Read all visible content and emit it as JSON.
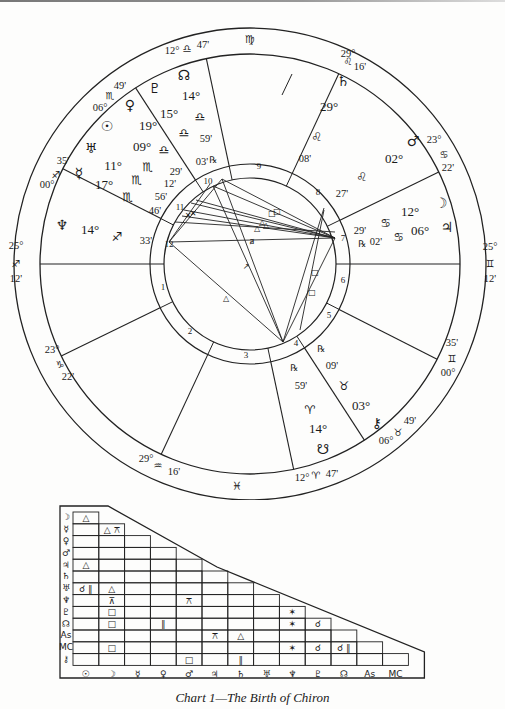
{
  "caption": "Chart 1—The Birth of Chiron",
  "chart_data": {
    "type": "astrological-natal-chart",
    "title": "Chart 1—The Birth of Chiron",
    "house_cusps": [
      {
        "house": 1,
        "label": "Asc",
        "degree": "25°",
        "sign": "♐",
        "minute": "12'"
      },
      {
        "house": 2,
        "degree": "23°",
        "sign": "♑",
        "minute": "22'"
      },
      {
        "house": 3,
        "degree": "29°",
        "sign": "♒",
        "minute": "16'"
      },
      {
        "house": 4,
        "label": "IC",
        "degree": "12°",
        "sign": "♈",
        "minute": "47'"
      },
      {
        "house": 5,
        "degree": "06°",
        "sign": "♉",
        "minute": "49'"
      },
      {
        "house": 6,
        "degree": "00°",
        "sign": "♊",
        "minute": "35'"
      },
      {
        "house": 7,
        "label": "Dsc",
        "degree": "25°",
        "sign": "♊",
        "minute": "12'"
      },
      {
        "house": 8,
        "degree": "23°",
        "sign": "♋",
        "minute": "22'"
      },
      {
        "house": 9,
        "degree": "29°",
        "sign": "♌",
        "minute": "16'"
      },
      {
        "house": 10,
        "label": "MC",
        "degree": "12°",
        "sign": "♎",
        "minute": "47'"
      },
      {
        "house": 11,
        "degree": "06°",
        "sign": "♏",
        "minute": "49'"
      },
      {
        "house": 12,
        "degree": "00°",
        "sign": "♐",
        "minute": "35'"
      }
    ],
    "intercepted_signs": [
      {
        "sign": "♍",
        "position": "top"
      },
      {
        "sign": "♓",
        "position": "bottom"
      }
    ],
    "planets": [
      {
        "name": "Sun",
        "glyph": "☉",
        "degree": "09°",
        "sign": "♏",
        "minute": "12'"
      },
      {
        "name": "Moon",
        "glyph": "☽",
        "degree": "12°",
        "sign": "♋",
        "minute": "29'"
      },
      {
        "name": "Mercury",
        "glyph": "☿",
        "degree": "17°",
        "sign": "♏",
        "minute": "46'"
      },
      {
        "name": "Venus",
        "glyph": "♀",
        "degree": "19°",
        "sign": "♎",
        "minute": "29'"
      },
      {
        "name": "Mars",
        "glyph": "♂",
        "degree": "02°",
        "sign": "♌",
        "minute": "27'"
      },
      {
        "name": "Jupiter",
        "glyph": "♃",
        "degree": "06°",
        "sign": "♋",
        "minute": "02'",
        "retrograde": true
      },
      {
        "name": "Saturn",
        "glyph": "♄",
        "degree": "29°",
        "sign": "♌",
        "minute": "08'"
      },
      {
        "name": "Uranus",
        "glyph": "♅",
        "degree": "11°",
        "sign": "♏",
        "minute": "56'"
      },
      {
        "name": "Neptune",
        "glyph": "♆",
        "degree": "14°",
        "sign": "♐",
        "minute": "33'"
      },
      {
        "name": "Pluto",
        "glyph": "♇",
        "degree": "15°",
        "sign": "♎",
        "minute": "03'",
        "retrograde": true
      },
      {
        "name": "North Node",
        "glyph": "☊",
        "degree": "14°",
        "sign": "♎",
        "minute": "59'"
      },
      {
        "name": "South Node",
        "glyph": "☋",
        "degree": "14°",
        "sign": "♈",
        "minute": "59'",
        "retrograde": true
      },
      {
        "name": "Chiron",
        "glyph": "⚷",
        "degree": "03°",
        "sign": "♉",
        "minute": "09'",
        "retrograde": true
      }
    ],
    "aspect_grid": {
      "columns": [
        "☉",
        "☽",
        "☿",
        "♀",
        "♂",
        "♃",
        "♄",
        "♅",
        "♆",
        "♇",
        "☊",
        "Asc",
        "MC"
      ],
      "rows": [
        "☽",
        "☿",
        "♀",
        "♂",
        "♃",
        "♄",
        "♅",
        "♆",
        "♇",
        "☊",
        "Asc",
        "MC",
        "⚷"
      ],
      "cells": [
        {
          "row": "☽",
          "col": "☉",
          "aspect": "△"
        },
        {
          "row": "☿",
          "col": "☽",
          "aspect": "△ ⚻"
        },
        {
          "row": "♃",
          "col": "☉",
          "aspect": "△"
        },
        {
          "row": "♅",
          "col": "☉",
          "aspect": "☌ ∥"
        },
        {
          "row": "♅",
          "col": "☽",
          "aspect": "△"
        },
        {
          "row": "♆",
          "col": "☽",
          "aspect": "⊼"
        },
        {
          "row": "♆",
          "col": "♂",
          "aspect": "⚻"
        },
        {
          "row": "♇",
          "col": "☽",
          "aspect": "□"
        },
        {
          "row": "♇",
          "col": "♆",
          "aspect": "✶"
        },
        {
          "row": "☊",
          "col": "☽",
          "aspect": "□"
        },
        {
          "row": "☊",
          "col": "♀",
          "aspect": "∥"
        },
        {
          "row": "☊",
          "col": "♆",
          "aspect": "✶"
        },
        {
          "row": "☊",
          "col": "♇",
          "aspect": "☌"
        },
        {
          "row": "Asc",
          "col": "♃",
          "aspect": "⚻"
        },
        {
          "row": "Asc",
          "col": "♄",
          "aspect": "△"
        },
        {
          "row": "MC",
          "col": "☽",
          "aspect": "□"
        },
        {
          "row": "MC",
          "col": "♆",
          "aspect": "✶"
        },
        {
          "row": "MC",
          "col": "♇",
          "aspect": "☌"
        },
        {
          "row": "MC",
          "col": "☊",
          "aspect": "☌ ∥"
        },
        {
          "row": "⚷",
          "col": "♂",
          "aspect": "□"
        },
        {
          "row": "⚷",
          "col": "♄",
          "aspect": "∥"
        }
      ]
    }
  }
}
